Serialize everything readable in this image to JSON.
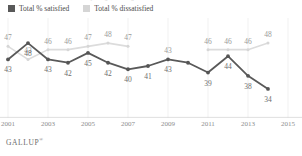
{
  "title_sliver": "Americans' Satisfaction With the Way Things Are Going in the U.S.",
  "legend": {
    "items": [
      {
        "label": "Total % satisfied",
        "swatch": "dark-square-icon",
        "color": "#595959"
      },
      {
        "label": "Total % dissatisfied",
        "swatch": "light-square-icon",
        "color": "#d5d5d5"
      }
    ]
  },
  "xaxis": {
    "ticks": [
      "2001",
      "2003",
      "2005",
      "2007",
      "2009",
      "2011",
      "2013",
      "2015"
    ]
  },
  "footer": {
    "brand": "GALLUP",
    "mark": "®"
  },
  "chart_data": {
    "type": "line",
    "title": "Americans' Satisfaction With the Way Things Are Going in the U.S.",
    "xlabel": "",
    "ylabel": "",
    "ylim": [
      30,
      52
    ],
    "grid": false,
    "legend_position": "top-left",
    "x": [
      2001,
      2002,
      2003,
      2004,
      2005,
      2006,
      2007,
      2008,
      2009,
      2010,
      2011,
      2012,
      2013,
      2014,
      2015
    ],
    "categories": [
      "2001",
      "2002",
      "2003",
      "2004",
      "2005",
      "2006",
      "2007",
      "2008",
      "2009",
      "2010",
      "2011",
      "2012",
      "2013",
      "2014",
      "2015"
    ],
    "series": [
      {
        "name": "Total % satisfied",
        "color": "#595959",
        "values": [
          43,
          48,
          43,
          42,
          45,
          42,
          40,
          41,
          43,
          42,
          39,
          44,
          38,
          34,
          null
        ],
        "labels": [
          "43",
          "48",
          "43",
          "42",
          "45",
          "42",
          "40",
          "41",
          "43",
          "",
          "39",
          "44",
          "38",
          "34",
          ""
        ]
      },
      {
        "name": "Total % dissatisfied",
        "color": "#d5d5d5",
        "values": [
          47,
          43,
          46,
          46,
          47,
          48,
          47,
          null,
          43,
          null,
          46,
          46,
          46,
          48,
          null
        ],
        "labels": [
          "47",
          "43",
          "46",
          "46",
          "47",
          "48",
          "47",
          "",
          "43",
          "",
          "46",
          "46",
          "46",
          "48",
          ""
        ]
      }
    ]
  }
}
